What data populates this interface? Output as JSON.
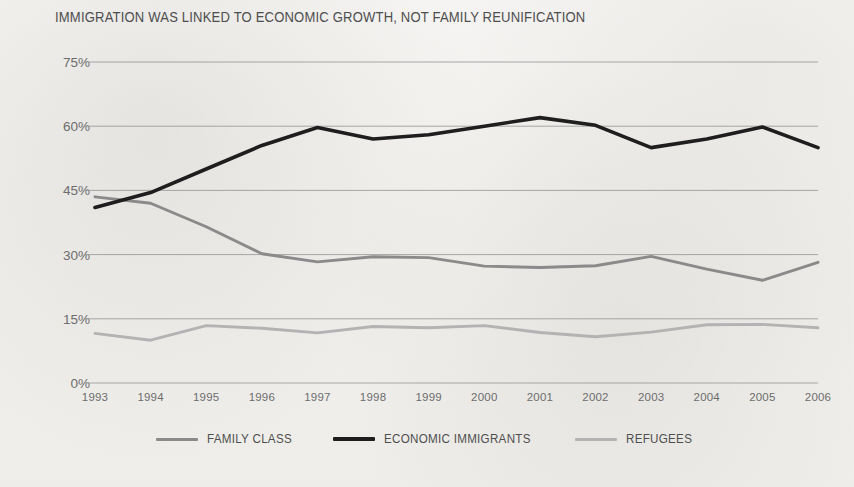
{
  "chart_data": {
    "type": "line",
    "title": "IMMIGRATION WAS LINKED TO ECONOMIC GROWTH, NOT FAMILY REUNIFICATION",
    "xlabel": "",
    "ylabel": "",
    "grid": true,
    "legend_position": "bottom",
    "ylim": [
      0,
      75
    ],
    "yticks": [
      0,
      15,
      30,
      45,
      60,
      75
    ],
    "ytick_labels": [
      "0%",
      "15%",
      "30%",
      "45%",
      "60%",
      "75%"
    ],
    "categories": [
      1993,
      1994,
      1995,
      1996,
      1997,
      1998,
      1999,
      2000,
      2001,
      2002,
      2003,
      2004,
      2005,
      2006
    ],
    "xtick_labels": [
      "1993",
      "1994",
      "1995",
      "1996",
      "1997",
      "1998",
      "1999",
      "2000",
      "2001",
      "2002",
      "2003",
      "2004",
      "2005",
      "2006"
    ],
    "series": [
      {
        "name": "FAMILY CLASS",
        "color": "#8a8a8a",
        "values": [
          43.5,
          42.0,
          36.5,
          30.2,
          28.3,
          29.5,
          29.3,
          27.3,
          27.0,
          27.4,
          29.6,
          26.6,
          24.0,
          28.2
        ]
      },
      {
        "name": "ECONOMIC IMMIGRANTS",
        "color": "#1e1e1e",
        "values": [
          41.0,
          44.5,
          50.0,
          55.5,
          59.7,
          57.0,
          58.0,
          60.0,
          62.0,
          60.2,
          55.0,
          57.0,
          59.8,
          55.0
        ]
      },
      {
        "name": "REFUGEES",
        "color": "#b3b3b3",
        "values": [
          11.6,
          10.0,
          13.4,
          12.8,
          11.7,
          13.2,
          12.9,
          13.4,
          11.8,
          10.8,
          11.9,
          13.6,
          13.7,
          12.9
        ]
      }
    ]
  },
  "legend": {
    "items": [
      {
        "label": "FAMILY CLASS",
        "color": "#8a8a8a",
        "thickness": 3
      },
      {
        "label": "ECONOMIC IMMIGRANTS",
        "color": "#1e1e1e",
        "thickness": 3.5
      },
      {
        "label": "REFUGEES",
        "color": "#b3b3b3",
        "thickness": 3
      }
    ]
  },
  "colors": {
    "background": "#f3f2f0",
    "gridline": "#9a9a9a",
    "axis_text": "#6d6d6d",
    "title_text": "#4e4e4e"
  }
}
